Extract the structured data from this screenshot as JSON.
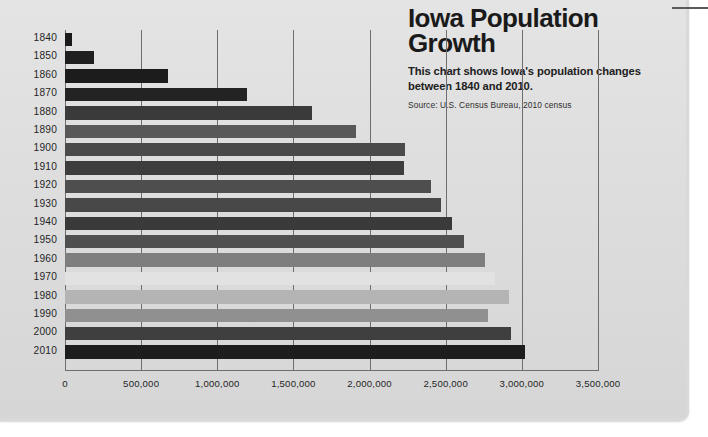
{
  "header": {
    "title": "Iowa Population Growth",
    "subtitle": "This chart shows Iowa's population changes between 1840 and 2010.",
    "source": "Source: U.S. Census Bureau, 2010 census"
  },
  "chart_data": {
    "type": "bar",
    "orientation": "horizontal",
    "title": "Iowa Population Growth",
    "subtitle": "This chart shows Iowa's population changes between 1840 and 2010.",
    "source": "Source: U.S. Census Bureau, 2010 census",
    "xlabel": "",
    "ylabel": "",
    "xlim": [
      0,
      3500000
    ],
    "xticks": [
      0,
      500000,
      1000000,
      1500000,
      2000000,
      2500000,
      3000000,
      3500000
    ],
    "xtick_labels": [
      "0",
      "500,000",
      "1,000,000",
      "1,500,000",
      "2,000,000",
      "2,500,000",
      "3,000,000",
      "3,500,000"
    ],
    "grid": true,
    "legend": false,
    "categories": [
      "1840",
      "1850",
      "1860",
      "1870",
      "1880",
      "1890",
      "1900",
      "1910",
      "1920",
      "1930",
      "1940",
      "1950",
      "1960",
      "1970",
      "1980",
      "1990",
      "2000",
      "2010"
    ],
    "values": [
      43000,
      192000,
      675000,
      1194000,
      1625000,
      1912000,
      2232000,
      2225000,
      2404000,
      2471000,
      2538000,
      2621000,
      2758000,
      2825000,
      2914000,
      2777000,
      2926000,
      3020000
    ],
    "bar_colors": [
      "#1a1a1a",
      "#1f1f1f",
      "#1c1c1c",
      "#232323",
      "#3a3a3a",
      "#585858",
      "#4a4a4a",
      "#3d3d3d",
      "#4e4e4e",
      "#484848",
      "#3a3a3a",
      "#4f4f4f",
      "#7e7e7e",
      "#e2e2e2",
      "#b4b4b4",
      "#909090",
      "#3f3f3f",
      "#1d1d1d"
    ]
  },
  "colors": {
    "page_background": "#dedede",
    "grid": "#6e6e6e",
    "text": "#1f1f1f"
  }
}
